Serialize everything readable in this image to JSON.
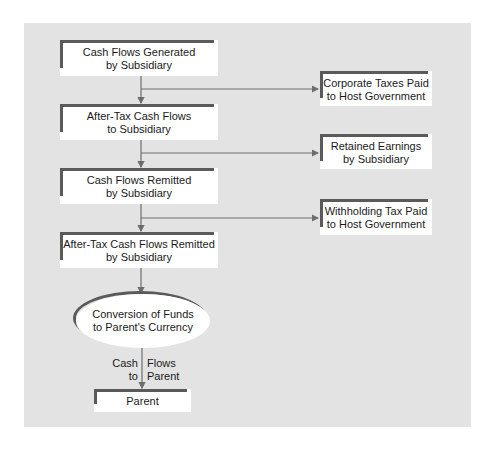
{
  "diagram": {
    "main_flow": [
      {
        "id": "generated",
        "label": "Cash Flows Generated\nby Subsidiary"
      },
      {
        "id": "after_tax",
        "label": "After-Tax Cash Flows\nto Subsidiary"
      },
      {
        "id": "remitted",
        "label": "Cash Flows Remitted\nby Subsidiary"
      },
      {
        "id": "after_tax_remitted",
        "label": "After-Tax Cash Flows Remitted\nby Subsidiary"
      }
    ],
    "side_outflows": [
      {
        "id": "corporate_taxes",
        "label": "Corporate Taxes Paid\nto Host Government"
      },
      {
        "id": "retained",
        "label": "Retained Earnings\nby Subsidiary"
      },
      {
        "id": "withholding",
        "label": "Withholding Tax Paid\nto Host Government"
      }
    ],
    "conversion": {
      "label": "Conversion of Funds\nto Parent's Currency"
    },
    "final_arrow_label": {
      "left": "Cash\nto",
      "right": "Flows\nParent"
    },
    "parent": {
      "label": "Parent"
    }
  },
  "colors": {
    "panel": "#e3e3e3",
    "box": "#ffffff",
    "accent_bar": "#5a5a5a",
    "line": "#6e6e6e"
  }
}
